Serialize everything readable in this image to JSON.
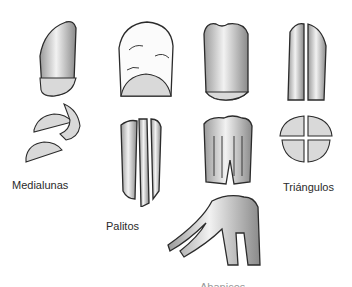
{
  "figure": {
    "title": "",
    "labels": {
      "medialunas": "Medialunas",
      "palitos": "Palitos",
      "triangulos": "Triángulos",
      "bottom_cropped": "Abanicos"
    },
    "illustrations": [
      {
        "name": "carrot-whole-1",
        "caption": "Medialunas"
      },
      {
        "name": "carrot-whole-2",
        "caption": "Palitos"
      },
      {
        "name": "carrot-whole-3",
        "caption": "Abanicos"
      },
      {
        "name": "carrot-whole-4",
        "caption": "Triángulos"
      }
    ],
    "colors": {
      "ink": "#2b2b2b",
      "background": "#ffffff"
    }
  }
}
